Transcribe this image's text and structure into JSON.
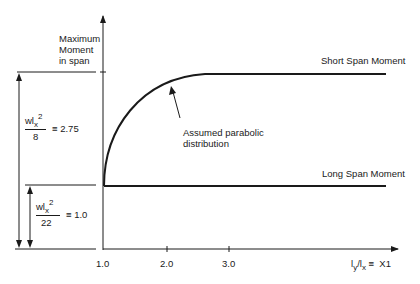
{
  "diagram": {
    "y_axis_label": [
      "Maximum",
      "Moment",
      "in span"
    ],
    "x_axis_label": {
      "main": "l",
      "sub1": "y",
      "slash": "/l",
      "sub2": "x",
      "suffix": " ≡  X1"
    },
    "x_ticks": [
      "1.0",
      "2.0",
      "3.0"
    ],
    "curves": {
      "short_span": {
        "label": "Short Span Moment",
        "value": 2.75
      },
      "long_span": {
        "label": "Long Span Moment",
        "value": 1.0
      }
    },
    "annotation": [
      "Assumed parabolic",
      "distribution"
    ],
    "dimension_upper": {
      "num": "wl",
      "sub": "x",
      "sup": "2",
      "den": "8",
      "eq": "≡  2.75"
    },
    "dimension_lower": {
      "num": "wl",
      "sub": "x",
      "sup": "2",
      "den": "22",
      "eq": "≡  1.0"
    },
    "colors": {
      "ink": "#1a1a1a",
      "background": "#ffffff"
    }
  }
}
